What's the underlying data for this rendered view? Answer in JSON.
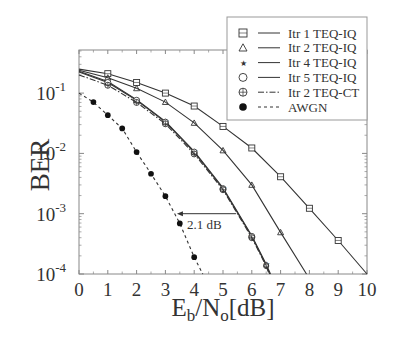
{
  "chart_data": {
    "type": "line",
    "title": "",
    "xlabel": "Eb/No[dB]",
    "xlabel_parts": {
      "E": "E",
      "b": "b",
      "slash_N": "/N",
      "o": "o",
      "unit": "[dB]"
    },
    "ylabel": "BER",
    "yscale": "log",
    "xlim": [
      0,
      10
    ],
    "ylim": [
      0.0001,
      0.52
    ],
    "x_ticks": [
      0,
      1,
      2,
      3,
      4,
      5,
      6,
      7,
      8,
      9,
      10
    ],
    "y_ticks": [
      {
        "value": 0.1,
        "base": "10",
        "exp": "-1"
      },
      {
        "value": 0.01,
        "base": "10",
        "exp": "-2"
      },
      {
        "value": 0.001,
        "base": "10",
        "exp": "-3"
      },
      {
        "value": 0.0001,
        "base": "10",
        "exp": "-4"
      }
    ],
    "grid": false,
    "legend_position": "upper right",
    "series": [
      {
        "name": "Itr 1 TEQ-IQ",
        "marker": "square",
        "line": "solid",
        "x": [
          0,
          1,
          2,
          3,
          4,
          5,
          6,
          7,
          8,
          9,
          10
        ],
        "values": [
          0.25,
          0.21,
          0.15,
          0.1,
          0.061,
          0.028,
          0.0123,
          0.0041,
          0.00123,
          0.00036,
          0.0001
        ]
      },
      {
        "name": "Itr 2 TEQ-IQ",
        "marker": "triangle",
        "line": "solid",
        "x": [
          0,
          1,
          2,
          3,
          4,
          5,
          6,
          7,
          7.9
        ],
        "values": [
          0.24,
          0.18,
          0.12,
          0.071,
          0.032,
          0.0112,
          0.003,
          0.00049,
          0.0001
        ]
      },
      {
        "name": "Itr 4 TEQ-IQ",
        "marker": "star",
        "line": "solid",
        "x": [
          0,
          1,
          2,
          3,
          4,
          5,
          6,
          6.5,
          6.65
        ],
        "values": [
          0.23,
          0.155,
          0.078,
          0.034,
          0.0108,
          0.0027,
          0.00043,
          0.000145,
          0.0001
        ]
      },
      {
        "name": "Itr 5 TEQ-IQ",
        "marker": "circle",
        "line": "solid",
        "x": [
          0,
          1,
          2,
          3,
          4,
          5,
          6,
          6.5,
          6.62
        ],
        "values": [
          0.225,
          0.15,
          0.076,
          0.033,
          0.0105,
          0.0026,
          0.00042,
          0.00014,
          0.0001
        ]
      },
      {
        "name": "Itr 2 TEQ-CT",
        "marker": "circle-plus",
        "line": "dashdot",
        "x": [
          0,
          1,
          2,
          3,
          4,
          5,
          6,
          6.5,
          6.6
        ],
        "values": [
          0.2,
          0.135,
          0.07,
          0.031,
          0.0098,
          0.0025,
          0.0004,
          0.000135,
          0.0001
        ]
      },
      {
        "name": "AWGN",
        "marker": "filled-circle",
        "line": "dashed",
        "x": [
          0,
          0.5,
          1,
          1.5,
          2,
          2.5,
          3,
          3.5,
          4,
          4.3
        ],
        "values": [
          0.1,
          0.071,
          0.043,
          0.026,
          0.0105,
          0.0046,
          0.00195,
          0.00069,
          0.00019,
          0.0001
        ]
      }
    ],
    "annotations": [
      {
        "text": "2.1 dB",
        "type": "arrow",
        "from_x": 5.45,
        "to_x": 3.4,
        "y": 0.001
      }
    ]
  },
  "legend": {
    "items": [
      {
        "label": "Itr 1 TEQ-IQ",
        "marker": "square-icon",
        "line": "solid"
      },
      {
        "label": "Itr 2 TEQ-IQ",
        "marker": "triangle-icon",
        "line": "solid"
      },
      {
        "label": "Itr 4 TEQ-IQ",
        "marker": "star-icon",
        "line": "solid"
      },
      {
        "label": "Itr 5 TEQ-IQ",
        "marker": "circle-icon",
        "line": "solid"
      },
      {
        "label": "Itr 2 TEQ-CT",
        "marker": "circle-plus-icon",
        "line": "dashdot"
      },
      {
        "label": "AWGN",
        "marker": "filled-circle-icon",
        "line": "dashed"
      }
    ]
  },
  "colors": {
    "line": "#333333",
    "axis": "#888888",
    "text": "#333333",
    "background": "#ffffff"
  }
}
